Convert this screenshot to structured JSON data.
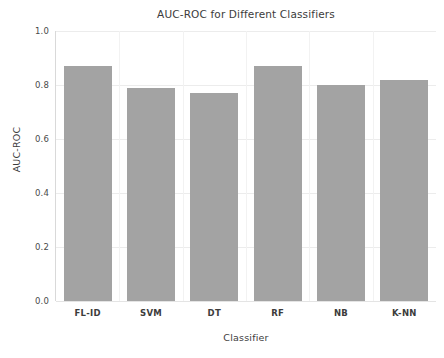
{
  "chart_data": {
    "type": "bar",
    "title": "AUC-ROC for Different Classifiers",
    "xlabel": "Classifier",
    "ylabel": "AUC-ROC",
    "categories": [
      "FL-ID",
      "SVM",
      "DT",
      "RF",
      "NB",
      "K-NN"
    ],
    "values": [
      0.87,
      0.79,
      0.77,
      0.87,
      0.8,
      0.82
    ],
    "ylim": [
      0.0,
      1.0
    ],
    "yticks": [
      "0.0",
      "0.2",
      "0.4",
      "0.6",
      "0.8",
      "1.0"
    ],
    "ytick_values": [
      0.0,
      0.2,
      0.4,
      0.6,
      0.8,
      1.0
    ],
    "grid": true,
    "legend": "none",
    "bar_color": "#a3a3a3",
    "background_color": "#ffffff",
    "gridline_color": "#ececec"
  }
}
